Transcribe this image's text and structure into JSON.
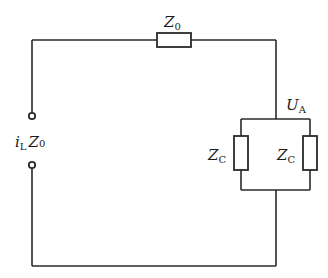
{
  "diagram": {
    "type": "circuit",
    "labels": {
      "series_impedance": {
        "main": "Z",
        "sub": "0"
      },
      "source": {
        "current": {
          "main": "i",
          "sub": "L"
        },
        "impedance": {
          "main": "Z",
          "sub": "0"
        }
      },
      "node_voltage": {
        "main": "U",
        "sub": "A"
      },
      "branch_left": {
        "main": "Z",
        "sub": "C"
      },
      "branch_right": {
        "main": "Z",
        "sub": "C"
      }
    },
    "components": [
      {
        "id": "Z0",
        "kind": "impedance",
        "position": "top wire"
      },
      {
        "id": "ZC_left",
        "kind": "impedance",
        "position": "parallel branch left"
      },
      {
        "id": "ZC_right",
        "kind": "impedance",
        "position": "parallel branch right"
      }
    ],
    "terminals": 2,
    "colors": {
      "line": "#2a2a2a",
      "background": "#ffffff"
    }
  }
}
